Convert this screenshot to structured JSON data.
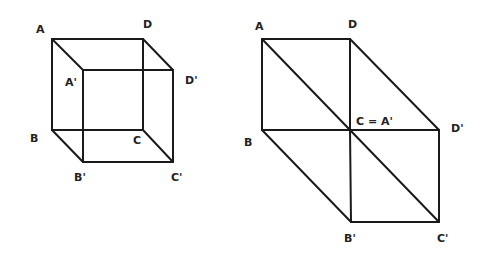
{
  "figures": [
    {
      "name": "cube-perspective",
      "vertices": {
        "A": [
          52,
          39
        ],
        "D": [
          143,
          39
        ],
        "B": [
          52,
          130
        ],
        "C": [
          143,
          130
        ],
        "A'": [
          83,
          70
        ],
        "D'": [
          173,
          70
        ],
        "B'": [
          83,
          162
        ],
        "C'": [
          173,
          162
        ]
      },
      "edges": [
        [
          "A",
          "D"
        ],
        [
          "A",
          "B"
        ],
        [
          "D",
          "C"
        ],
        [
          "B",
          "C"
        ],
        [
          "A'",
          "D'"
        ],
        [
          "A'",
          "B'"
        ],
        [
          "D'",
          "C'"
        ],
        [
          "B'",
          "C'"
        ],
        [
          "A",
          "A'"
        ],
        [
          "D",
          "D'"
        ],
        [
          "B",
          "B'"
        ],
        [
          "C",
          "C'"
        ]
      ],
      "labels": [
        {
          "text": "A",
          "x": 36,
          "y": 33
        },
        {
          "text": "D",
          "x": 143,
          "y": 28
        },
        {
          "text": "A'",
          "x": 65,
          "y": 86
        },
        {
          "text": "D'",
          "x": 185,
          "y": 84
        },
        {
          "text": "B",
          "x": 30,
          "y": 142
        },
        {
          "text": "C",
          "x": 133,
          "y": 144
        },
        {
          "text": "B'",
          "x": 74,
          "y": 181
        },
        {
          "text": "C'",
          "x": 171,
          "y": 181
        }
      ]
    },
    {
      "name": "cube-projection",
      "vertices": {
        "A": [
          262,
          39
        ],
        "D": [
          350,
          39
        ],
        "B": [
          262,
          130
        ],
        "C": [
          350,
          130
        ],
        "D'": [
          439,
          130
        ],
        "B'": [
          351,
          222
        ],
        "C'": [
          439,
          222
        ]
      },
      "edges": [
        [
          "A",
          "D"
        ],
        [
          "A",
          "B"
        ],
        [
          "D",
          "C"
        ],
        [
          "B",
          "C"
        ],
        [
          "C",
          "D'"
        ],
        [
          "C",
          "B'"
        ],
        [
          "D'",
          "C'"
        ],
        [
          "B'",
          "C'"
        ],
        [
          "A",
          "C"
        ],
        [
          "C",
          "C'"
        ],
        [
          "D",
          "D'"
        ],
        [
          "B",
          "B'"
        ]
      ],
      "labels": [
        {
          "text": "A",
          "x": 255,
          "y": 30
        },
        {
          "text": "D",
          "x": 348,
          "y": 28
        },
        {
          "text": "C = A'",
          "x": 356,
          "y": 125
        },
        {
          "text": "D'",
          "x": 451,
          "y": 132
        },
        {
          "text": "B",
          "x": 244,
          "y": 146
        },
        {
          "text": "B'",
          "x": 344,
          "y": 242
        },
        {
          "text": "C'",
          "x": 437,
          "y": 242
        }
      ]
    }
  ]
}
